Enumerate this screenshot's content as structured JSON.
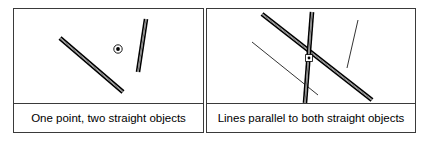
{
  "figure": {
    "width": 429,
    "height": 145,
    "background_color": "#ffffff",
    "stroke_color": "#000000",
    "border_color": "#3a3a3a",
    "panel_count": 2
  },
  "panels": [
    {
      "id": "panel-left",
      "caption": "One point, two straight objects",
      "shapes": [
        {
          "name": "straight-object-diagonal",
          "kind": "thick-bar",
          "x1": 60,
          "y1": 38,
          "x2": 123,
          "y2": 92,
          "width": 3.2,
          "color": "#000000"
        },
        {
          "name": "straight-object-steep",
          "kind": "thick-bar",
          "x1": 146,
          "y1": 19,
          "x2": 138,
          "y2": 72,
          "width": 3.2,
          "color": "#000000"
        },
        {
          "name": "point-marker",
          "kind": "bullseye-point",
          "cx": 118,
          "cy": 49,
          "outer_r": 4.2,
          "inner_r": 1.9,
          "color": "#000000"
        }
      ]
    },
    {
      "id": "panel-right",
      "caption": "Lines parallel to both straight objects",
      "shapes": [
        {
          "name": "straight-object-diagonal",
          "kind": "thick-bar",
          "x1": 262,
          "y1": 14,
          "x2": 372,
          "y2": 100,
          "width": 3.2,
          "color": "#000000"
        },
        {
          "name": "straight-object-steep",
          "kind": "thick-bar",
          "x1": 312,
          "y1": 12,
          "x2": 305,
          "y2": 103,
          "width": 3.2,
          "color": "#000000"
        },
        {
          "name": "parallel-line-diagonal",
          "kind": "thin-line",
          "x1": 252,
          "y1": 42,
          "x2": 318,
          "y2": 95,
          "width": 0.8,
          "color": "#000000"
        },
        {
          "name": "parallel-line-steep",
          "kind": "thin-line",
          "x1": 358,
          "y1": 20,
          "x2": 347,
          "y2": 68,
          "width": 0.8,
          "color": "#000000"
        },
        {
          "name": "intersection-point-marker",
          "kind": "bullseye-point",
          "cx": 309,
          "cy": 58,
          "outer_r": 3.4,
          "inner_r": 1.4,
          "color": "#000000"
        }
      ]
    }
  ]
}
